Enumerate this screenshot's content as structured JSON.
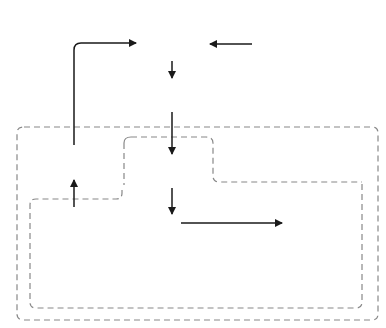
{
  "nodes": {
    "ip_network": {
      "label": "IP network",
      "line1": "IP",
      "line2": "network"
    },
    "traffic_demand": {
      "line1": "Traffic",
      "line2": "demand"
    },
    "link_utilization": {
      "label": "Link utilization",
      "math": "u_l(t)",
      "math_display": "uₗ(t)"
    },
    "virtual_network": {
      "label": "Virtual network",
      "math_display": "g(t)"
    },
    "activity": {
      "label": "Activity",
      "math_display": "α(t)"
    },
    "system_state": {
      "label": "System state",
      "math_display": "xᵢ(t)"
    },
    "deterministic": {
      "label": "Deterministic behavior",
      "math_display": "ς (x₁(t),…,xᵢ(t))"
    },
    "stochastic": {
      "line1": "Stochastic",
      "line2": "behavior",
      "math_display": "η"
    },
    "multiply": {
      "symbol": "⊗"
    },
    "add": {
      "symbol": "⊕"
    }
  },
  "labels": {
    "external_influence": "External influence",
    "condition": "Condition of IP network",
    "vn_control_line1": "Virtual network control",
    "vn_control_line2": "based on attractor selection",
    "attractor_selection": "Attractor selection"
  },
  "step_numbers": {
    "n1": "1",
    "n2": "2",
    "n3": "3",
    "n4": "4",
    "n5": "5"
  },
  "colors": {
    "line": "#2a2a2a",
    "dashed": "#777777",
    "background": "#ffffff"
  }
}
